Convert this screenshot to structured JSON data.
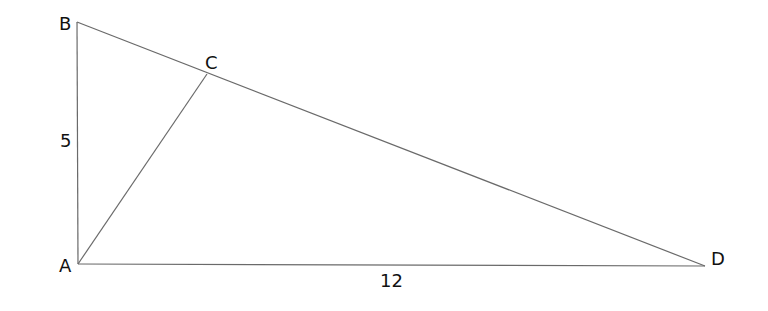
{
  "diagram": {
    "type": "geometry",
    "points": {
      "A": {
        "label": "A",
        "x": 78,
        "y": 264
      },
      "B": {
        "label": "B",
        "x": 77,
        "y": 22
      },
      "C": {
        "label": "C",
        "x": 207,
        "y": 74
      },
      "D": {
        "label": "D",
        "x": 705,
        "y": 266
      }
    },
    "segments": [
      {
        "from": "A",
        "to": "B"
      },
      {
        "from": "B",
        "to": "D"
      },
      {
        "from": "A",
        "to": "D"
      },
      {
        "from": "A",
        "to": "C"
      }
    ],
    "measurements": {
      "AB": "5",
      "AD": "12"
    },
    "colors": {
      "line": "#6a6a6a",
      "text": "#111111",
      "background": "#ffffff"
    }
  }
}
